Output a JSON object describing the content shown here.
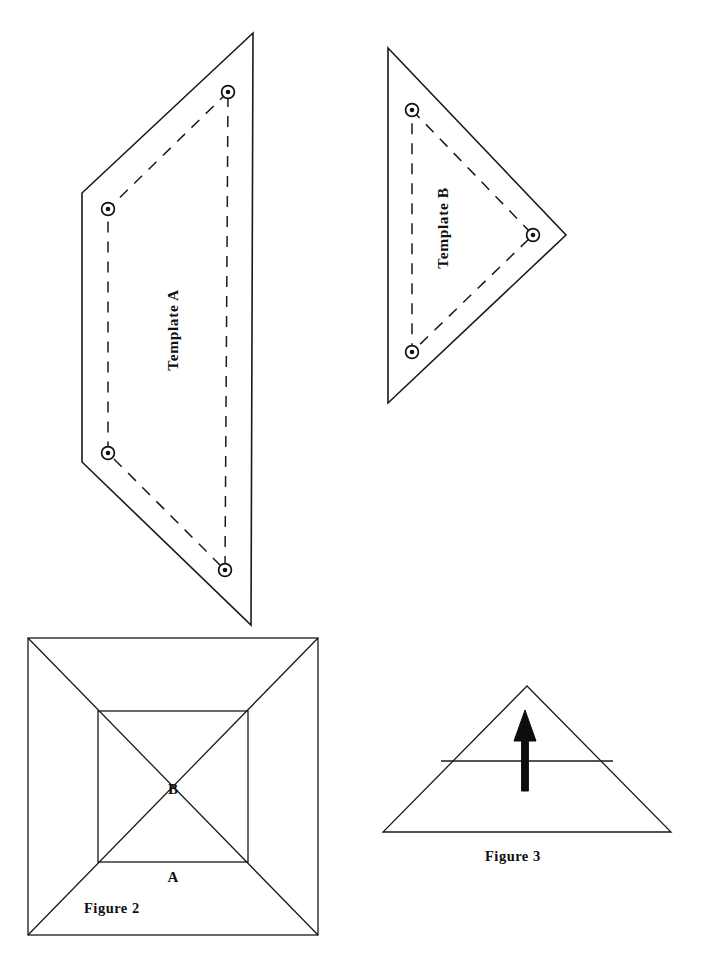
{
  "page": {
    "background_color": "#ffffff",
    "ink_color": "#1a1a1a",
    "width": 705,
    "height": 965
  },
  "figures": {
    "template_a": {
      "label": "Template A",
      "shape": "quadrilateral",
      "outline_points": "253,33 82,193 82,462 251,625",
      "dashed_points": "228,92 108,209 108,453 225,570",
      "markers": [
        {
          "name": "marker-top-right",
          "cx": 228,
          "cy": 92
        },
        {
          "name": "marker-top-left",
          "cx": 108,
          "cy": 209
        },
        {
          "name": "marker-bottom-left",
          "cx": 108,
          "cy": 453
        },
        {
          "name": "marker-bottom-right",
          "cx": 225,
          "cy": 570
        }
      ],
      "label_x": 178,
      "label_y": 330,
      "label_rotation": -90
    },
    "template_b": {
      "label": "Template B",
      "shape": "triangle",
      "outline_points": "388,48 566,235 388,403",
      "dashed_points": "412,110 533,235 412,352",
      "markers": [
        {
          "name": "marker-top",
          "cx": 412,
          "cy": 110
        },
        {
          "name": "marker-right",
          "cx": 533,
          "cy": 235
        },
        {
          "name": "marker-bottom",
          "cx": 412,
          "cy": 352
        }
      ],
      "label_x": 448,
      "label_y": 228,
      "label_rotation": -90
    },
    "figure_2": {
      "caption": "Figure 2",
      "caption_x": 84,
      "caption_y": 913,
      "outer_square": {
        "x": 28,
        "y": 638,
        "width": 290,
        "height": 297
      },
      "inner_square": {
        "x": 98,
        "y": 711,
        "width": 150,
        "height": 151
      },
      "diagonals": [
        "28,638 318,935",
        "318,638 28,935"
      ],
      "region_labels": [
        {
          "name": "inner-region-label",
          "text": "B",
          "x": 173,
          "y": 794
        },
        {
          "name": "outer-region-label",
          "text": "A",
          "x": 173,
          "y": 882
        }
      ]
    },
    "figure_3": {
      "caption": "Figure 3",
      "caption_x": 485,
      "caption_y": 861,
      "triangle_points": "527,686 671,832 383,832",
      "crossbar": {
        "x1": 441,
        "y1": 761,
        "x2": 613,
        "y2": 761
      },
      "arrow": {
        "shaft_x": 525,
        "tail_y": 791,
        "head_y": 712,
        "head_half_width": 11,
        "shaft_half_width": 3.4
      }
    }
  }
}
